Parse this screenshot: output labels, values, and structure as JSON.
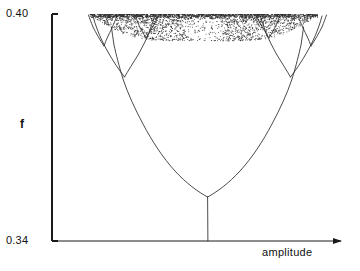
{
  "figure": {
    "title": "",
    "background_color": "#ffffff",
    "ink_color": "#1a1a1a"
  },
  "axes": {
    "y_label": "f",
    "x_label": "amplitude",
    "y_tick_top_label": "0.40",
    "y_tick_bottom_label": "0.34",
    "x_axis_has_arrow": true,
    "y_axis_has_arrow": false
  },
  "chart_data": {
    "type": "line",
    "title": "",
    "xlabel": "amplitude",
    "ylabel": "f",
    "ylim": [
      0.34,
      0.4
    ],
    "xlim": [
      0.0,
      1.0
    ],
    "y_ticks": [
      0.34,
      0.4
    ],
    "y_tick_labels": [
      "0.34",
      "0.40"
    ],
    "x_ticks": [],
    "x_tick_labels": [],
    "grid": false,
    "legend": null,
    "series": [
      {
        "name": "stem",
        "comment": "single period-1 branch from x-axis up to first pitchfork point",
        "x": [
          0.518,
          0.518
        ],
        "y": [
          0.34,
          0.3517
        ]
      },
      {
        "name": "left-primary-branch",
        "comment": "left arm of first pitchfork, rising to the second bifurcation",
        "x": [
          0.518,
          0.49,
          0.456,
          0.419,
          0.384,
          0.353,
          0.328,
          0.309,
          0.296
        ],
        "y": [
          0.3517,
          0.356,
          0.3625,
          0.3706,
          0.3794,
          0.3876,
          0.3938,
          0.3976,
          0.3994
        ]
      },
      {
        "name": "right-primary-branch",
        "comment": "right arm of first pitchfork, rising to the second bifurcation",
        "x": [
          0.518,
          0.547,
          0.582,
          0.62,
          0.656,
          0.688,
          0.714,
          0.734,
          0.747
        ],
        "y": [
          0.3517,
          0.356,
          0.3625,
          0.3706,
          0.3794,
          0.3876,
          0.3938,
          0.3976,
          0.3994
        ]
      },
      {
        "name": "left-secondary-pair",
        "comment": "period-4 split off the left primary branch near f = 0.3835",
        "x": [
          0.37,
          0.342,
          0.316,
          0.296,
          0.284
        ],
        "y": [
          0.3835,
          0.3897,
          0.3948,
          0.3981,
          0.3998
        ]
      },
      {
        "name": "right-secondary-pair",
        "comment": "period-4 split off the right primary branch near f = 0.3835",
        "x": [
          0.668,
          0.696,
          0.722,
          0.742,
          0.754
        ],
        "y": [
          0.3835,
          0.3897,
          0.3948,
          0.3981,
          0.3998
        ]
      },
      {
        "name": "chaotic-band",
        "comment": "dense scatter of points filling the top of the plot",
        "y_range": [
          0.393,
          0.4
        ],
        "x_range": [
          0.13,
          0.92
        ]
      }
    ]
  }
}
